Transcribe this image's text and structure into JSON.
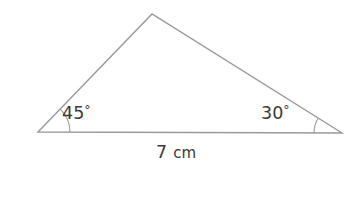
{
  "figure": {
    "background_color": "#ffffff",
    "stroke_color": "#9a9a9a",
    "text_color": "#3a3a3a"
  },
  "triangle": {
    "vertices": {
      "left": {
        "x": 38,
        "y": 132
      },
      "apex": {
        "x": 152,
        "y": 14
      },
      "right": {
        "x": 342,
        "y": 133
      }
    },
    "path": "M 38 132 L 152 14 L 342 133 Z"
  },
  "angles": [
    {
      "id": "left-angle",
      "value": "45",
      "degree_symbol": "°",
      "label": "45°",
      "vertex": "left",
      "label_x": 62,
      "label_y": 119,
      "arc_path": "M 70 132 A 32 32 0 0 0 60.5 109.4"
    },
    {
      "id": "right-angle",
      "value": "30",
      "degree_symbol": "°",
      "label": "30°",
      "vertex": "right",
      "label_x": 261,
      "label_y": 119,
      "arc_path": "M 314 133 A 28 28 0 0 1 317.8 118.8"
    }
  ],
  "side_labels": [
    {
      "id": "base-length",
      "number": "7",
      "unit": "cm",
      "full_text": "7 cm",
      "x": 176,
      "y": 158
    }
  ]
}
